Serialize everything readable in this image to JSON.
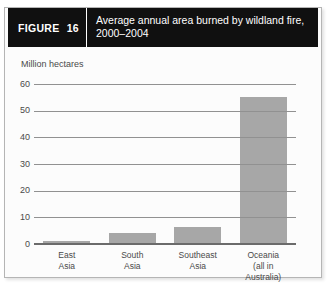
{
  "header": {
    "figure_label": "FIGURE 16",
    "title": "Average annual area burned by wildland fire, 2000–2004"
  },
  "chart_data": {
    "type": "bar",
    "title": "Average annual area burned by wildland fire, 2000–2004",
    "ylabel": "Million hectares",
    "xlabel": "",
    "categories": [
      "East\nAsia",
      "South\nAsia",
      "Southeast\nAsia",
      "Oceania\n(all in Australia)"
    ],
    "values": [
      1,
      4,
      6.5,
      55
    ],
    "ylim": [
      0,
      60
    ],
    "yticks": [
      0,
      10,
      20,
      30,
      40,
      50,
      60
    ],
    "grid": true,
    "legend": "none"
  },
  "colors": {
    "header_bg": "#101010",
    "header_text": "#ffffff",
    "frame_border": "#b5b5b5",
    "bar": "#a7a7a7",
    "gridline": "#919191",
    "baseline": "#6b6b6b",
    "axis_text": "#4a4a4a"
  }
}
